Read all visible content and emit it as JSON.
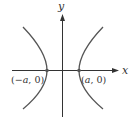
{
  "diagram": {
    "type": "hyperbola",
    "equation_form": "horizontal transverse axis",
    "axes": {
      "x_label": "x",
      "y_label": "y"
    },
    "vertices": [
      {
        "label_prefix": "(−",
        "var": "a",
        "label_suffix": ", 0)",
        "text": "(−a, 0)"
      },
      {
        "label_prefix": "(",
        "var": "a",
        "label_suffix": ", 0)",
        "text": "(a, 0)"
      }
    ],
    "colors": {
      "curve": "#555555",
      "axis": "#333333",
      "point": "#555555",
      "background": "#ffffff"
    }
  }
}
